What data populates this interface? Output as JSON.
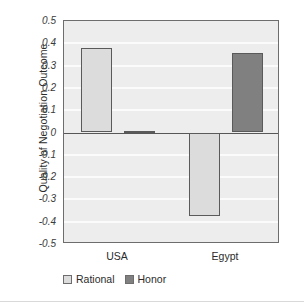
{
  "chart_data": {
    "type": "bar",
    "title": "",
    "xlabel": "",
    "ylabel": "Quality of Negotiation Outcome",
    "categories": [
      "USA",
      "Egypt"
    ],
    "series": [
      {
        "name": "Rational",
        "color": "#dcdcdc",
        "values": [
          0.38,
          -0.375
        ]
      },
      {
        "name": "Honor",
        "color": "#808080",
        "values": [
          0.007,
          0.355
        ]
      }
    ],
    "ylim": [
      -0.5,
      0.5
    ],
    "ytick_values": [
      0.5,
      0.4,
      0.3,
      0.2,
      0.1,
      0,
      -0.1,
      -0.2,
      -0.3,
      -0.4,
      -0.5
    ],
    "ytick_labels": [
      "0.5",
      "0.4",
      "0.3",
      "0.2",
      "0.1",
      "0",
      "-0.1",
      "-0.2",
      "-0.3",
      "-0.4",
      "-0.5"
    ],
    "grid": true,
    "legend_position": "bottom"
  },
  "legend": {
    "entries": [
      {
        "label": "Rational"
      },
      {
        "label": "Honor"
      }
    ]
  }
}
